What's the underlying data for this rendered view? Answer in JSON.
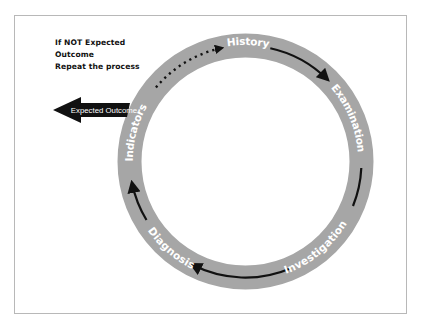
{
  "note": {
    "lines": [
      "If NOT Expected",
      "Outcome",
      "Repeat the process"
    ]
  },
  "exit_arrow": {
    "label": "Expected Outcome",
    "color": "#111111"
  },
  "cycle": {
    "ring_color": "#a6a6a6",
    "arrow_color": "#111111",
    "label_color": "#ffffff",
    "stages": [
      {
        "label": "History"
      },
      {
        "label": "Examination"
      },
      {
        "label": "Investigation"
      },
      {
        "label": "Diagnosis"
      },
      {
        "label": "Indicators"
      }
    ],
    "loop_back": {
      "from": "Indicators",
      "to": "History",
      "style": "dotted"
    }
  }
}
